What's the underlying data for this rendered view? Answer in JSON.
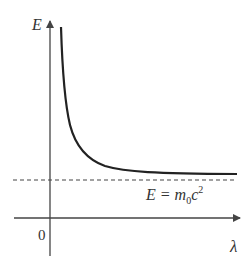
{
  "diagram": {
    "type": "energy-wavelength curve",
    "axes": {
      "y_label": "E",
      "x_label": "λ",
      "origin_label": "0"
    },
    "asymptote": {
      "label_lhs": "E = m",
      "label_sub": "0",
      "label_c": "c",
      "label_sup": "2",
      "style": "dashed"
    },
    "curve": {
      "description": "E decreases with λ, approaching E = m0c^2 asymptotically"
    },
    "colors": {
      "axis": "#444444",
      "curve": "#222222",
      "text": "#333333"
    }
  }
}
